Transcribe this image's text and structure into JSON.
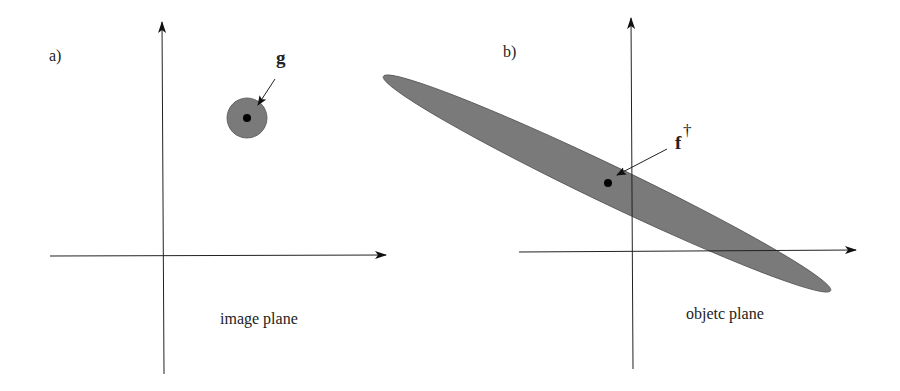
{
  "panels": [
    {
      "id": "a",
      "label": "a)",
      "caption": "image plane",
      "vector_label": "g",
      "region_shape": "circle"
    },
    {
      "id": "b",
      "label": "b)",
      "caption": "objetc plane",
      "vector_label": "f",
      "vector_superscript": "†",
      "region_shape": "ellipse"
    }
  ],
  "colors": {
    "region_fill": "#7a7a7a",
    "point": "#000000",
    "axis": "#222222"
  }
}
